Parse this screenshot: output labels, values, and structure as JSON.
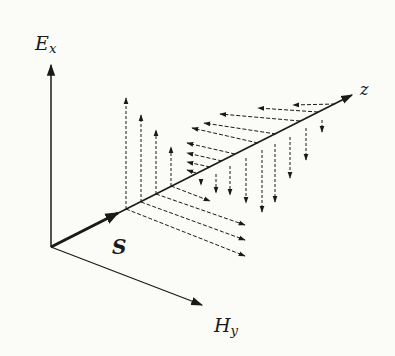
{
  "diagram": {
    "labels": {
      "e_axis": "E",
      "e_axis_sub": "x",
      "h_axis": "H",
      "h_axis_sub": "y",
      "z_axis": "z",
      "poynting": "S"
    },
    "colors": {
      "ink": "#1a1a1a",
      "background": "#fbfbf7"
    },
    "geometry": {
      "origin": [
        51,
        247
      ],
      "e_axis_tip": [
        51,
        65
      ],
      "h_axis_tip": [
        202,
        305
      ],
      "z_axis_tip": [
        352,
        95
      ],
      "s_arrow_tip": [
        118,
        213
      ]
    },
    "e_up_arrows": [
      {
        "base": [
          126,
          209
        ],
        "tip": [
          126,
          98
        ]
      },
      {
        "base": [
          141,
          202
        ],
        "tip": [
          141,
          115
        ]
      },
      {
        "base": [
          156,
          194
        ],
        "tip": [
          156,
          130
        ]
      },
      {
        "base": [
          171,
          186
        ],
        "tip": [
          171,
          147
        ]
      }
    ],
    "e_down_arrows": [
      {
        "base": [
          201,
          181
        ],
        "tip": [
          201,
          185
        ]
      },
      {
        "base": [
          216,
          174
        ],
        "tip": [
          216,
          193
        ]
      },
      {
        "base": [
          230,
          166
        ],
        "tip": [
          230,
          195
        ]
      },
      {
        "base": [
          246,
          158
        ],
        "tip": [
          246,
          203
        ]
      },
      {
        "base": [
          262,
          150
        ],
        "tip": [
          262,
          212
        ]
      },
      {
        "base": [
          275,
          144
        ],
        "tip": [
          275,
          202
        ]
      },
      {
        "base": [
          290,
          137
        ],
        "tip": [
          290,
          178
        ]
      },
      {
        "base": [
          306,
          128
        ],
        "tip": [
          306,
          160
        ]
      },
      {
        "base": [
          322,
          120
        ],
        "tip": [
          322,
          132
        ]
      }
    ],
    "h_right_arrows": [
      {
        "base": [
          126,
          209
        ],
        "tip": [
          245,
          256
        ]
      },
      {
        "base": [
          141,
          202
        ],
        "tip": [
          245,
          240
        ]
      },
      {
        "base": [
          156,
          194
        ],
        "tip": [
          245,
          225
        ]
      },
      {
        "base": [
          171,
          186
        ],
        "tip": [
          210,
          201
        ]
      }
    ],
    "h_left_arrows": [
      {
        "base": [
          196,
          173
        ],
        "tip": [
          187,
          170
        ]
      },
      {
        "base": [
          210,
          167
        ],
        "tip": [
          187,
          162
        ]
      },
      {
        "base": [
          222,
          161
        ],
        "tip": [
          187,
          153
        ]
      },
      {
        "base": [
          235,
          154
        ],
        "tip": [
          187,
          143
        ]
      },
      {
        "base": [
          258,
          143
        ],
        "tip": [
          192,
          128
        ]
      },
      {
        "base": [
          276,
          134
        ],
        "tip": [
          204,
          123
        ]
      },
      {
        "base": [
          300,
          121
        ],
        "tip": [
          220,
          114
        ]
      },
      {
        "base": [
          318,
          112
        ],
        "tip": [
          258,
          108
        ]
      },
      {
        "base": [
          335,
          104
        ],
        "tip": [
          293,
          105
        ]
      }
    ]
  }
}
